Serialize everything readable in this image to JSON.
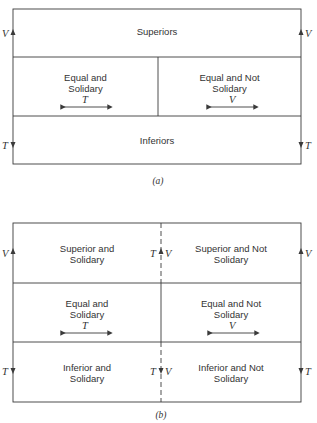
{
  "figure_a": {
    "caption": "(a)",
    "top_cell": "Superiors",
    "middle_left": {
      "line1": "Equal and",
      "line2": "Solidary",
      "symbol": "T"
    },
    "middle_right": {
      "line1": "Equal and Not",
      "line2": "Solidary",
      "symbol": "V"
    },
    "bottom_cell": "Inferiors",
    "left_up_label": "V",
    "right_up_label": "V",
    "left_down_label": "T",
    "right_down_label": "T"
  },
  "figure_b": {
    "caption": "(b)",
    "top_left": {
      "line1": "Superior and",
      "line2": "Solidary"
    },
    "top_right": {
      "line1": "Superior and Not",
      "line2": "Solidary"
    },
    "middle_left": {
      "line1": "Equal and",
      "line2": "Solidary",
      "symbol": "T"
    },
    "middle_right": {
      "line1": "Equal and Not",
      "line2": "Solidary",
      "symbol": "V"
    },
    "bottom_left": {
      "line1": "Inferior and",
      "line2": "Solidary"
    },
    "bottom_right": {
      "line1": "Inferior and Not",
      "line2": "Solidary"
    },
    "left_up_label": "V",
    "right_up_label": "V",
    "center_up_left_label": "T",
    "center_up_right_label": "V",
    "left_down_label": "T",
    "right_down_label": "T",
    "center_down_left_label": "T",
    "center_down_right_label": "V"
  },
  "colors": {
    "line": "#3a3a3a",
    "text": "#333333"
  }
}
